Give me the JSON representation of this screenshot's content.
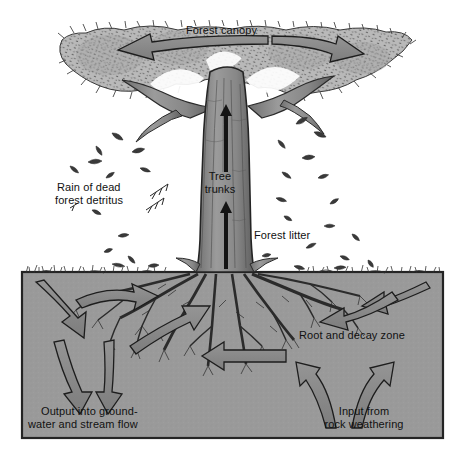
{
  "diagram": {
    "type": "labelled-cross-section-diagram",
    "canvas": {
      "width": 468,
      "height": 464
    },
    "colors": {
      "background": "#ffffff",
      "soil": "#9a9a9a",
      "soil_border": "#2b2b2b",
      "canopy_fill": "#b9b9b9",
      "canopy_stipple": "#4a4a4a",
      "trunk_fill": "#8d8d8d",
      "trunk_outline": "#2a2a2a",
      "arrow_fill": "#8a8a8a",
      "arrow_outline": "#1d1d1d",
      "thin_arrow": "#141414",
      "leaf": "#3a3a3a",
      "text": "#111111"
    }
  },
  "labels": {
    "canopy": "Forest canopy",
    "trunks_line1": "Tree",
    "trunks_line2": "trunks",
    "detritus_line1": "Rain of dead",
    "detritus_line2": "forest detritus",
    "forest_litter": "Forest litter",
    "root_zone": "Root and decay zone",
    "output_line1": "Output into ground-",
    "output_line2": "water and stream flow",
    "input_line1": "Input from",
    "input_line2": "rock weathering"
  },
  "arrows": [
    {
      "name": "canopy-spread-left",
      "label": "Forest canopy",
      "direction": "left",
      "style": "curved-broad"
    },
    {
      "name": "canopy-spread-right",
      "label": "Forest canopy",
      "direction": "right",
      "style": "curved-broad"
    },
    {
      "name": "trunk-uptake-upper",
      "label": "Tree trunks",
      "direction": "up",
      "style": "thin-line"
    },
    {
      "name": "trunk-uptake-lower",
      "label": "Tree trunks",
      "direction": "up",
      "style": "thin-line"
    },
    {
      "name": "soil-infiltration-left",
      "direction": "down-right",
      "style": "curved-broad"
    },
    {
      "name": "soil-lateral-left",
      "direction": "right",
      "style": "curved-broad"
    },
    {
      "name": "soil-lateral-right-upper",
      "direction": "left",
      "style": "curved-broad"
    },
    {
      "name": "soil-infiltration-right",
      "direction": "down-left",
      "style": "curved-broad"
    },
    {
      "name": "root-uptake-inner",
      "direction": "up-right",
      "style": "curved-broad"
    },
    {
      "name": "root-lateral-center",
      "direction": "left",
      "style": "straight-broad"
    },
    {
      "name": "output-leach-left-a",
      "label": "Output into ground-water and stream flow",
      "direction": "down",
      "style": "curved-broad"
    },
    {
      "name": "output-leach-left-b",
      "label": "Output into ground-water and stream flow",
      "direction": "down",
      "style": "curved-broad"
    },
    {
      "name": "input-weathering-left",
      "label": "Input from rock weathering",
      "direction": "up-left",
      "style": "curved-broad"
    },
    {
      "name": "input-weathering-right",
      "label": "Input from rock weathering",
      "direction": "up-right",
      "style": "curved-broad"
    }
  ]
}
